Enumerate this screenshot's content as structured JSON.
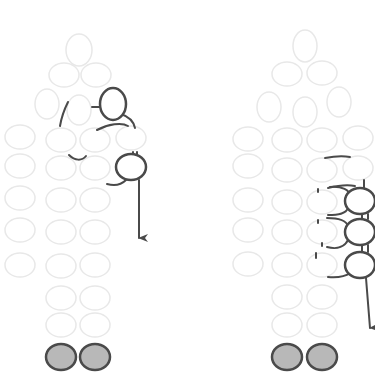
{
  "diagram": {
    "title": "Beadwork thread path diagram",
    "colors": {
      "background": "#ffffff",
      "light_bead_stroke": "#e8e8e8",
      "dark_bead_stroke": "#4a4a4a",
      "thread": "#4a4a4a",
      "filled_bead": "#b8b8b8"
    },
    "panels": [
      {
        "id": "left",
        "label": "Step A",
        "light_beads": [
          [
            79,
            50,
            13,
            16
          ],
          [
            64,
            75,
            15,
            12
          ],
          [
            96,
            75,
            15,
            12
          ],
          [
            47,
            104,
            12,
            15
          ],
          [
            79,
            110,
            12,
            15
          ],
          [
            113,
            103,
            12,
            15
          ],
          [
            20,
            137,
            15,
            12
          ],
          [
            61,
            140,
            15,
            12
          ],
          [
            95,
            140,
            15,
            12
          ],
          [
            131,
            138,
            15,
            12
          ],
          [
            20,
            166,
            15,
            12
          ],
          [
            61,
            168,
            15,
            12
          ],
          [
            95,
            168,
            15,
            12
          ],
          [
            20,
            198,
            15,
            12
          ],
          [
            61,
            200,
            15,
            12
          ],
          [
            95,
            200,
            15,
            12
          ],
          [
            20,
            230,
            15,
            12
          ],
          [
            61,
            232,
            15,
            12
          ],
          [
            95,
            232,
            15,
            12
          ],
          [
            20,
            265,
            15,
            12
          ],
          [
            61,
            266,
            15,
            12
          ],
          [
            95,
            265,
            15,
            12
          ],
          [
            61,
            298,
            15,
            12
          ],
          [
            95,
            298,
            15,
            12
          ],
          [
            61,
            325,
            15,
            12
          ],
          [
            95,
            325,
            15,
            12
          ]
        ],
        "dark_beads": [
          [
            113,
            104,
            13,
            16
          ],
          [
            131,
            167,
            15,
            13
          ]
        ],
        "filled_beads": [
          [
            61,
            357,
            15,
            13
          ],
          [
            95,
            357,
            15,
            13
          ]
        ],
        "arrow_end": [
          138,
          240
        ]
      },
      {
        "id": "right",
        "label": "Step B",
        "light_beads": [
          [
            305,
            46,
            12,
            16
          ],
          [
            287,
            74,
            15,
            12
          ],
          [
            322,
            73,
            15,
            12
          ],
          [
            269,
            107,
            12,
            15
          ],
          [
            305,
            112,
            12,
            15
          ],
          [
            339,
            102,
            12,
            15
          ],
          [
            248,
            139,
            15,
            12
          ],
          [
            287,
            140,
            15,
            12
          ],
          [
            322,
            140,
            15,
            12
          ],
          [
            358,
            138,
            15,
            12
          ],
          [
            248,
            166,
            15,
            12
          ],
          [
            287,
            170,
            15,
            12
          ],
          [
            322,
            170,
            15,
            12
          ],
          [
            358,
            168,
            15,
            12
          ],
          [
            248,
            200,
            15,
            12
          ],
          [
            287,
            202,
            15,
            12
          ],
          [
            322,
            202,
            15,
            12
          ],
          [
            248,
            230,
            15,
            12
          ],
          [
            287,
            232,
            15,
            12
          ],
          [
            322,
            232,
            15,
            12
          ],
          [
            248,
            264,
            15,
            12
          ],
          [
            287,
            265,
            15,
            12
          ],
          [
            322,
            265,
            15,
            12
          ],
          [
            287,
            297,
            15,
            12
          ],
          [
            322,
            297,
            15,
            12
          ],
          [
            287,
            325,
            15,
            12
          ],
          [
            322,
            325,
            15,
            12
          ]
        ],
        "dark_beads": [
          [
            360,
            201,
            15,
            13
          ],
          [
            360,
            232,
            15,
            13
          ],
          [
            360,
            265,
            15,
            13
          ]
        ],
        "filled_beads": [
          [
            287,
            357,
            15,
            13
          ],
          [
            322,
            357,
            15,
            13
          ]
        ],
        "arrow_end": [
          370,
          330
        ]
      }
    ]
  }
}
